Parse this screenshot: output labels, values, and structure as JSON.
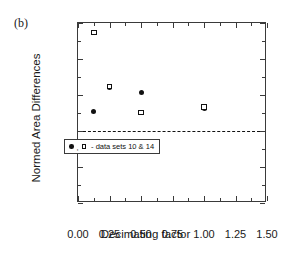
{
  "panel": {
    "label": "(b)"
  },
  "legend": {
    "comma": ",",
    "text": "- data sets 10 & 14",
    "filled_marker_name": "filled-circle",
    "open_marker_name": "open-square"
  },
  "chart_data": {
    "type": "scatter",
    "title": "",
    "xlabel": "Decimating factor",
    "ylabel": "Normed Area Differences",
    "xlim": [
      0.0,
      1.5
    ],
    "ylim": [
      0.0,
      2.5
    ],
    "xticks": [
      0.0,
      0.25,
      0.5,
      0.75,
      1.0,
      1.25,
      1.5
    ],
    "xtick_labels": [
      "0.00",
      "0.25",
      "0.50",
      "0.75",
      "1.00",
      "1.25",
      "1.50"
    ],
    "yticks": [
      0.0,
      0.5,
      1.0,
      1.5,
      2.0,
      2.5
    ],
    "ytick_labels": [
      "0.0",
      "0.5",
      "1.0",
      "1.5",
      "2.0",
      "2.5"
    ],
    "x_minor_ticks": [
      0.125,
      0.375,
      0.625,
      0.875,
      1.125,
      1.375
    ],
    "y_minor_ticks": [
      0.25,
      0.75,
      1.25,
      1.75,
      2.25
    ],
    "grid": false,
    "legend_position": "lower-right",
    "reference_lines": [
      {
        "axis": "y",
        "value": 1.0,
        "style": "dashed",
        "color": "#111111"
      }
    ],
    "series": [
      {
        "name": "data set 10",
        "marker": "filled-circle",
        "x": [
          0.125,
          0.25,
          0.5,
          1.0
        ],
        "y": [
          1.27,
          1.61,
          1.53,
          1.31
        ]
      },
      {
        "name": "data set 14",
        "marker": "open-square",
        "x": [
          0.125,
          0.25,
          0.5,
          1.0
        ],
        "y": [
          2.37,
          1.62,
          1.26,
          1.33
        ]
      }
    ]
  }
}
